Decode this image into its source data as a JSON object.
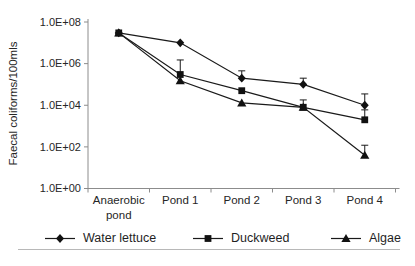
{
  "chart_data": {
    "type": "line",
    "title": "",
    "xlabel": "",
    "ylabel": "Faecal coliforms/100mls",
    "y_scale": "log",
    "ylim": [
      1.0,
      100000000.0
    ],
    "y_ticks": [
      "1.0E+08",
      "1.0E+06",
      "1.0E+04",
      "1.0E+02",
      "1.0E+00"
    ],
    "y_tick_values": [
      100000000.0,
      1000000.0,
      10000.0,
      100.0,
      1.0
    ],
    "categories": [
      "Anaerobic pond",
      "Pond 1",
      "Pond 2",
      "Pond 3",
      "Pond 4"
    ],
    "grid": "off",
    "legend_position": "bottom",
    "series": [
      {
        "name": "Water lettuce",
        "marker": "diamond",
        "values": [
          30000000.0,
          10000000.0,
          200000.0,
          100000.0,
          10000.0
        ],
        "upper_errors": [
          null,
          null,
          450000.0,
          200000.0,
          35000.0
        ]
      },
      {
        "name": "Duckweed",
        "marker": "square",
        "values": [
          30000000.0,
          300000.0,
          50000.0,
          8000.0,
          2000.0
        ],
        "upper_errors": [
          null,
          1500000.0,
          null,
          18000.0,
          6000.0
        ]
      },
      {
        "name": "Algae",
        "marker": "triangle",
        "values": [
          30000000.0,
          150000.0,
          13000.0,
          8000.0,
          40.0
        ],
        "upper_errors": [
          null,
          null,
          null,
          null,
          120.0
        ]
      }
    ],
    "colors": {
      "series_line": "#1a1a1a",
      "marker_fill": "#111111",
      "axis": "#8c8c8c",
      "tick_text": "#262626",
      "divider": "#b8b8b8",
      "background": "#ffffff"
    }
  }
}
